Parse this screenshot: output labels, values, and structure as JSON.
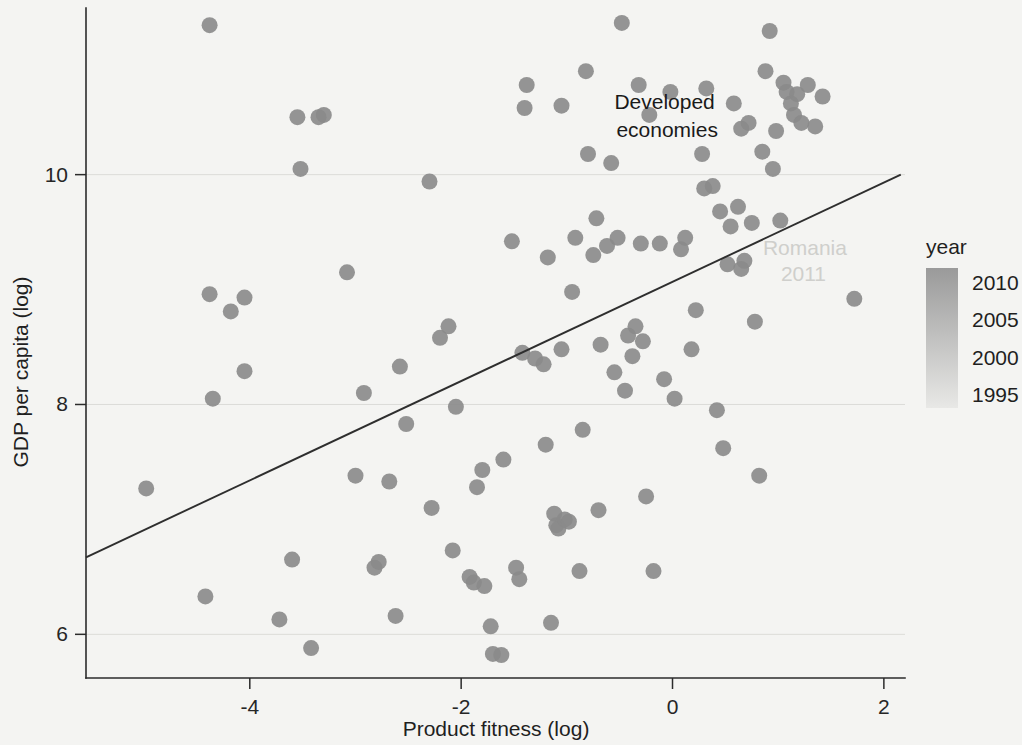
{
  "chart_data": {
    "type": "scatter",
    "title": "",
    "xlabel": "Product fitness (log)",
    "ylabel": "GDP per capita (log)",
    "xlim": [
      -5.55,
      2.2
    ],
    "ylim": [
      5.62,
      11.45
    ],
    "xticks": [
      -4,
      -2,
      0,
      2
    ],
    "xtick_labels": [
      "-4",
      "-2",
      "0",
      "2"
    ],
    "yticks": [
      6,
      8,
      10
    ],
    "ytick_labels": [
      "6",
      "8",
      "10"
    ],
    "grid": "horizontal-faint",
    "legend": {
      "title": "year",
      "type": "continuous-colorbar",
      "position": "right",
      "labels": [
        "2010",
        "2005",
        "2000",
        "1995"
      ],
      "values": [
        2010,
        2005,
        2000,
        1995
      ],
      "color_high": "#9a9a9a",
      "color_low": "#e8e8e6"
    },
    "annotations": [
      {
        "text_line1": "Developed",
        "text_line2": "economies",
        "x": -0.55,
        "y": 10.52,
        "style": "dark"
      },
      {
        "text_line1": "Romania",
        "text_line2": "2011",
        "x": 0.95,
        "y": 9.25,
        "style": "faint"
      }
    ],
    "trendline": {
      "type": "linear",
      "x0": -5.55,
      "y0": 6.67,
      "x1": 2.16,
      "y1": 10.0,
      "color": "#2e2e2e"
    },
    "point_color": "#8a8a8a",
    "point_radius_px": 8,
    "points": [
      [
        -4.98,
        7.27
      ],
      [
        -4.38,
        11.3
      ],
      [
        -4.42,
        6.33
      ],
      [
        -4.35,
        8.05
      ],
      [
        -4.38,
        8.96
      ],
      [
        -4.18,
        8.81
      ],
      [
        -4.05,
        8.93
      ],
      [
        -4.05,
        8.29
      ],
      [
        -3.72,
        6.13
      ],
      [
        -3.6,
        6.65
      ],
      [
        -3.55,
        10.5
      ],
      [
        -3.52,
        10.05
      ],
      [
        -3.42,
        5.88
      ],
      [
        -3.3,
        10.52
      ],
      [
        -3.08,
        9.15
      ],
      [
        -3.0,
        7.38
      ],
      [
        -2.92,
        8.1
      ],
      [
        -2.82,
        6.58
      ],
      [
        -2.78,
        6.63
      ],
      [
        -2.68,
        7.33
      ],
      [
        -2.62,
        6.16
      ],
      [
        -2.58,
        8.33
      ],
      [
        -2.52,
        7.83
      ],
      [
        -2.3,
        9.94
      ],
      [
        -2.28,
        7.1
      ],
      [
        -2.2,
        8.58
      ],
      [
        -2.12,
        8.68
      ],
      [
        -2.08,
        6.73
      ],
      [
        -2.05,
        7.98
      ],
      [
        -1.92,
        6.5
      ],
      [
        -1.88,
        6.45
      ],
      [
        -1.85,
        7.28
      ],
      [
        -1.8,
        7.43
      ],
      [
        -1.78,
        6.42
      ],
      [
        -1.72,
        6.07
      ],
      [
        -1.7,
        5.83
      ],
      [
        -1.62,
        5.82
      ],
      [
        -1.6,
        7.52
      ],
      [
        -1.52,
        9.42
      ],
      [
        -1.48,
        6.58
      ],
      [
        -1.45,
        6.48
      ],
      [
        -1.42,
        8.45
      ],
      [
        -1.4,
        10.58
      ],
      [
        -1.38,
        10.78
      ],
      [
        -1.3,
        8.4
      ],
      [
        -1.22,
        8.35
      ],
      [
        -1.2,
        7.65
      ],
      [
        -1.18,
        9.28
      ],
      [
        -1.15,
        6.1
      ],
      [
        -1.12,
        7.05
      ],
      [
        -1.1,
        6.95
      ],
      [
        -1.08,
        6.92
      ],
      [
        -1.05,
        8.48
      ],
      [
        -1.02,
        7.0
      ],
      [
        -0.98,
        6.98
      ],
      [
        -0.95,
        8.98
      ],
      [
        -0.92,
        9.45
      ],
      [
        -0.88,
        6.55
      ],
      [
        -0.85,
        7.78
      ],
      [
        -0.82,
        10.9
      ],
      [
        -0.8,
        10.18
      ],
      [
        -0.75,
        9.3
      ],
      [
        -0.7,
        7.08
      ],
      [
        -0.68,
        8.52
      ],
      [
        -0.62,
        9.38
      ],
      [
        -0.58,
        10.1
      ],
      [
        -0.55,
        8.28
      ],
      [
        -0.52,
        9.45
      ],
      [
        -0.48,
        11.32
      ],
      [
        -0.45,
        8.12
      ],
      [
        -0.42,
        8.6
      ],
      [
        -0.38,
        8.42
      ],
      [
        -0.35,
        8.68
      ],
      [
        -0.32,
        10.78
      ],
      [
        -0.3,
        9.4
      ],
      [
        -0.28,
        8.55
      ],
      [
        -0.25,
        7.2
      ],
      [
        -0.22,
        10.52
      ],
      [
        -0.18,
        6.55
      ],
      [
        -0.12,
        9.4
      ],
      [
        -0.08,
        8.22
      ],
      [
        -0.02,
        10.72
      ],
      [
        0.02,
        8.05
      ],
      [
        0.08,
        9.35
      ],
      [
        0.12,
        9.45
      ],
      [
        0.18,
        8.48
      ],
      [
        0.22,
        8.82
      ],
      [
        0.28,
        10.18
      ],
      [
        0.32,
        10.75
      ],
      [
        0.38,
        9.9
      ],
      [
        0.42,
        7.95
      ],
      [
        0.45,
        9.68
      ],
      [
        0.48,
        7.62
      ],
      [
        0.52,
        9.22
      ],
      [
        0.55,
        9.55
      ],
      [
        0.58,
        10.62
      ],
      [
        0.62,
        9.72
      ],
      [
        0.65,
        9.18
      ],
      [
        0.68,
        9.25
      ],
      [
        0.72,
        10.45
      ],
      [
        0.75,
        9.58
      ],
      [
        0.78,
        8.72
      ],
      [
        0.82,
        7.38
      ],
      [
        0.85,
        10.2
      ],
      [
        0.88,
        10.9
      ],
      [
        0.92,
        11.25
      ],
      [
        0.95,
        10.05
      ],
      [
        0.98,
        10.38
      ],
      [
        1.02,
        9.6
      ],
      [
        1.05,
        10.8
      ],
      [
        1.08,
        10.72
      ],
      [
        1.12,
        10.62
      ],
      [
        1.15,
        10.52
      ],
      [
        1.18,
        10.7
      ],
      [
        1.22,
        10.45
      ],
      [
        1.28,
        10.78
      ],
      [
        1.35,
        10.42
      ],
      [
        1.42,
        10.68
      ],
      [
        1.72,
        8.92
      ],
      [
        -3.35,
        10.5
      ],
      [
        0.3,
        9.88
      ],
      [
        0.65,
        10.4
      ],
      [
        -0.72,
        9.62
      ],
      [
        -1.05,
        10.6
      ]
    ]
  }
}
